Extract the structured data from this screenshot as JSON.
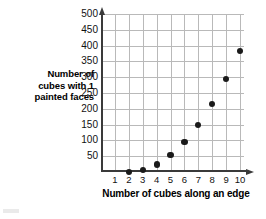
{
  "chart_data": {
    "type": "scatter",
    "title": "",
    "xlabel": "Number of cubes along an edge",
    "ylabel": "Number of\ncubes with 1\npainted faces",
    "ylabel_lines": [
      "Number of",
      "cubes with 1",
      "painted faces"
    ],
    "x": [
      2,
      3,
      4,
      5,
      6,
      7,
      8,
      9,
      10
    ],
    "values": [
      0,
      6,
      24,
      54,
      96,
      150,
      216,
      294,
      384
    ],
    "points": [
      {
        "x": 2,
        "y": 0
      },
      {
        "x": 3,
        "y": 6
      },
      {
        "x": 4,
        "y": 24
      },
      {
        "x": 5,
        "y": 54
      },
      {
        "x": 6,
        "y": 96
      },
      {
        "x": 7,
        "y": 150
      },
      {
        "x": 8,
        "y": 216
      },
      {
        "x": 9,
        "y": 294
      },
      {
        "x": 10,
        "y": 384
      }
    ],
    "xlim": [
      0,
      10.5
    ],
    "ylim": [
      0,
      500
    ],
    "xticks": [
      1,
      2,
      3,
      4,
      5,
      6,
      7,
      8,
      9,
      10
    ],
    "yticks": [
      50,
      100,
      150,
      200,
      250,
      300,
      350,
      400,
      450,
      500
    ],
    "xtick_labels": [
      "1",
      "2",
      "3",
      "4",
      "5",
      "6",
      "7",
      "8",
      "9",
      "10"
    ],
    "ytick_labels": [
      "50",
      "100",
      "150",
      "200",
      "250",
      "300",
      "350",
      "400",
      "450",
      "500"
    ],
    "grid": true,
    "legend": null,
    "marker_color": "#1a1a1a",
    "grid_color": "#b9b9b9",
    "axis_color": "#3a3a3a"
  }
}
